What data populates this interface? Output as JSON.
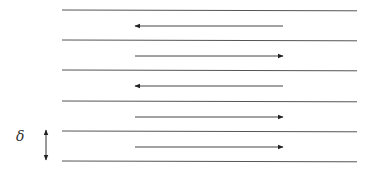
{
  "diagram": {
    "title": "",
    "layer_lines_y": [
      10,
      40,
      70,
      101,
      131,
      161
    ],
    "line_x": [
      62,
      357
    ],
    "line_color": "#555555",
    "arrows": [
      {
        "y": 26,
        "direction": "left"
      },
      {
        "y": 56,
        "direction": "right"
      },
      {
        "y": 86,
        "direction": "left"
      },
      {
        "y": 117,
        "direction": "right"
      },
      {
        "y": 147,
        "direction": "right"
      }
    ],
    "arrow_x": [
      135,
      283
    ],
    "thickness_label": "δ",
    "thickness_marker": {
      "x": 46,
      "y1": 130,
      "y2": 160
    }
  }
}
